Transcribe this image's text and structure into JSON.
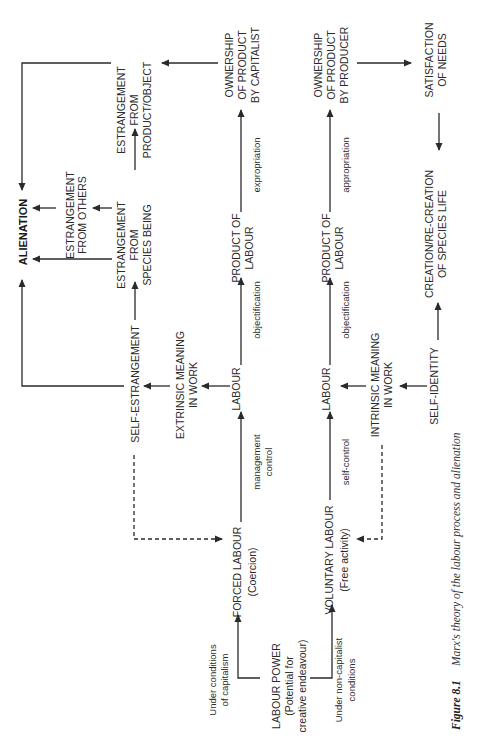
{
  "figure": {
    "number": "Figure 8.1",
    "caption": "Marx's theory of the labour process and alienation",
    "orientation": "rotated 90 degrees counter-clockwise"
  },
  "nodes": {
    "alienation": "ALIENATION",
    "estr_product_1": "ESTRANGEMENT",
    "estr_product_2": "FROM",
    "estr_product_3": "PRODUCT/OBJECT",
    "estr_others_1": "ESTRANGEMENT",
    "estr_others_2": "FROM OTHERS",
    "estr_species_1": "ESTRANGEMENT",
    "estr_species_2": "FROM",
    "estr_species_3": "SPECIES BEING",
    "self_estrangement": "SELF-ESTRANGEMENT",
    "extrinsic_1": "EXTRINSIC MEANING",
    "extrinsic_2": "IN WORK",
    "labour_cap": "LABOUR",
    "product_cap_1": "PRODUCT OF",
    "product_cap_2": "LABOUR",
    "own_cap_1": "OWNERSHIP",
    "own_cap_2": "OF  PRODUCT",
    "own_cap_3": "BY CAPITALIST",
    "own_prod_1": "OWNERSHIP",
    "own_prod_2": "OF  PRODUCT",
    "own_prod_3": "BY PRODUCER",
    "product_non_1": "PRODUCT OF",
    "product_non_2": "LABOUR",
    "labour_non": "LABOUR",
    "satisfaction_1": "SATISFACTION",
    "satisfaction_2": "OF NEEDS",
    "creation_1": "CREATION/RE-CREATION",
    "creation_2": "OF SPECIES LIFE",
    "intrinsic_1": "INTRINSIC MEANING",
    "intrinsic_2": "IN WORK",
    "self_identity": "SELF-IDENTITY",
    "forced_1": "FORCED LABOUR",
    "forced_2": "(Coercion)",
    "voluntary_1": "VOLUNTARY LABOUR",
    "voluntary_2": "(Free activity)",
    "labour_power_1": "LABOUR POWER",
    "labour_power_2": "(Potential for",
    "labour_power_3": "creative endeavour)"
  },
  "edge_labels": {
    "expropriation": "expropriation",
    "appropriation": "appropriation",
    "objectification_cap": "objectification",
    "objectification_non": "objectification",
    "management_1": "management",
    "management_2": "control",
    "self_control": "self-control",
    "cond_cap_1": "Under conditions",
    "cond_cap_2": "of capitalism",
    "cond_non_1": "Under non-capitalist",
    "cond_non_2": "conditions"
  }
}
